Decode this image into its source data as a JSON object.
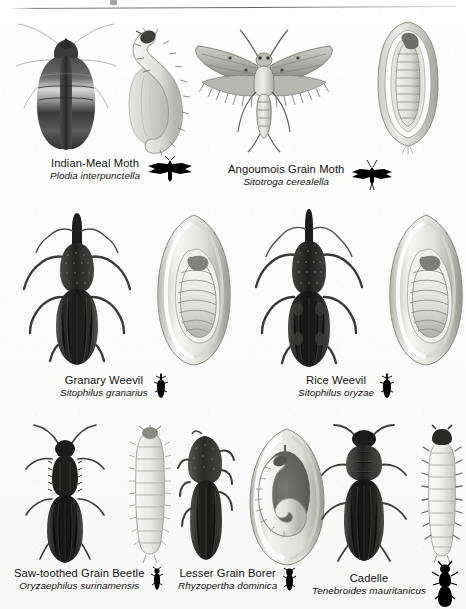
{
  "plate": {
    "title_rule": true,
    "background_color": "#fdfdfc",
    "ink_color": "#1a1a1a",
    "silhouette_color": "#000000"
  },
  "rows": [
    {
      "row_index": 1,
      "species": [
        {
          "common_name": "Indian-Meal Moth",
          "scientific_name": "Plodia interpunctella",
          "silhouette": "moth-silhouette-icon",
          "figures": [
            "adult-moth-dorsal",
            "larva-on-grain"
          ]
        },
        {
          "common_name": "Angoumois Grain Moth",
          "scientific_name": "Sitotroga cerealella",
          "silhouette": "moth-silhouette-icon",
          "figures": [
            "adult-moth-dorsal",
            "grain-kernel-cutaway-with-larva"
          ]
        }
      ]
    },
    {
      "row_index": 2,
      "species": [
        {
          "common_name": "Granary Weevil",
          "scientific_name": "Sitophilus granarius",
          "silhouette": "weevil-silhouette-icon",
          "figures": [
            "adult-weevil-dorsal",
            "grain-kernel-cutaway-with-larva"
          ]
        },
        {
          "common_name": "Rice Weevil",
          "scientific_name": "Sitophilus oryzae",
          "silhouette": "weevil-silhouette-icon",
          "figures": [
            "adult-weevil-dorsal",
            "grain-kernel-cutaway-with-larva"
          ]
        }
      ]
    },
    {
      "row_index": 3,
      "species": [
        {
          "common_name": "Saw-toothed Grain Beetle",
          "scientific_name": "Oryzaephilus surinamensis",
          "silhouette": "beetle-silhouette-icon",
          "figures": [
            "adult-beetle-dorsal",
            "larva-dorsal"
          ]
        },
        {
          "common_name": "Lesser Grain Borer",
          "scientific_name": "Rhyzopertha dominica",
          "silhouette": "beetle-silhouette-icon",
          "figures": [
            "adult-beetle-lateral",
            "grain-kernel-cutaway-with-grub"
          ]
        },
        {
          "common_name": "Cadelle",
          "scientific_name": "Tenebroides mauritanicus",
          "silhouette": "beetle-silhouette-icon",
          "figures": [
            "adult-beetle-dorsal",
            "larva-dorsal"
          ]
        }
      ]
    }
  ]
}
